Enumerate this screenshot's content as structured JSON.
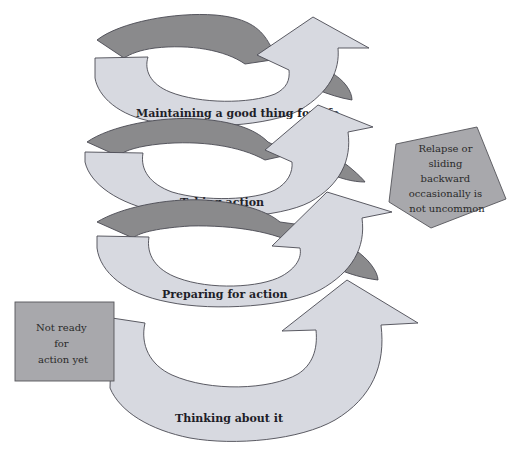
{
  "diagram": {
    "title": "",
    "type": "upward spiral of stages of change",
    "colors": {
      "band_fill": "#d7d9e0",
      "back_fill": "#8a8a8c",
      "note_fill": "#a8a8ac",
      "outline": "#4a4a52",
      "text": "#1e1e28"
    },
    "stages": [
      {
        "order": 1,
        "label": "Thinking about it"
      },
      {
        "order": 2,
        "label": "Preparing for action"
      },
      {
        "order": 3,
        "label": "Taking action"
      },
      {
        "order": 4,
        "label": "Maintaining a good thing for life"
      }
    ],
    "notes": {
      "not_ready": {
        "shape": "rectangle",
        "lines": [
          "Not ready",
          "for",
          "action yet"
        ]
      },
      "relapse": {
        "shape": "pentagon",
        "lines": [
          "Relapse or",
          "sliding",
          "backward",
          "occasionally is",
          "not uncommon"
        ]
      }
    }
  }
}
